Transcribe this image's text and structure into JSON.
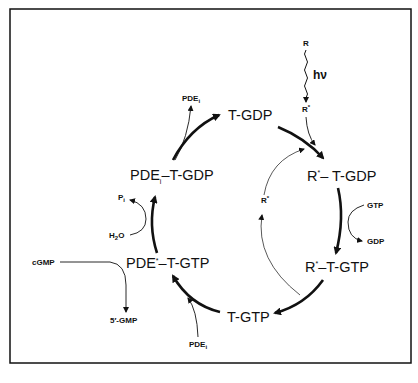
{
  "diagram": {
    "nodes": {
      "t_gdp": "T-GDP",
      "r_t_gdp_base": "R",
      "r_t_gdp_sup": "*",
      "r_t_gdp_rest": "– T-GDP",
      "r_t_gtp_base": "R",
      "r_t_gtp_sup": "*",
      "r_t_gtp_rest": "–T-GTP",
      "t_gtp": "T-GTP",
      "pde_t_gtp_base": "PDE",
      "pde_t_gtp_sup": "*",
      "pde_t_gtp_rest": "–T-GTP",
      "pdei_t_gdp_base": "PDE",
      "pdei_t_gdp_sub": "i",
      "pdei_t_gdp_rest": "–T-GDP"
    },
    "side_labels": {
      "r": "R",
      "hv": "hν",
      "r_star_top_base": "R",
      "r_star_top_sup": "*",
      "r_star_inner_base": "R",
      "r_star_inner_sup": "*",
      "gtp": "GTP",
      "gdp": "GDP",
      "pdei_bottom_base": "PDE",
      "pdei_bottom_sub": "i",
      "pdei_top_base": "PDE",
      "pdei_top_sub": "i",
      "pi_base": "P",
      "pi_sub": "i",
      "h2o_base": "H",
      "h2o_sub": "2",
      "h2o_rest": "O",
      "cgmp": "cGMP",
      "five_gmp": "5′-GMP"
    },
    "colors": {
      "stroke": "#111111",
      "background": "#ffffff"
    }
  }
}
